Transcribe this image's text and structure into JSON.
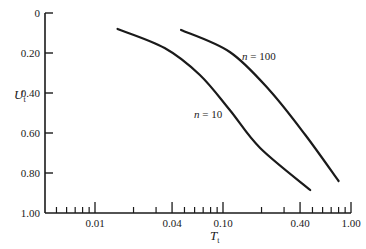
{
  "chart_data": {
    "type": "line",
    "title": "",
    "xlabel": "T_t",
    "ylabel": "U_t",
    "x_scale": "log",
    "y_inverted": true,
    "xlim": [
      0.004,
      1.0
    ],
    "ylim": [
      0,
      1.0
    ],
    "grid": false,
    "legend": "none (inline curve labels)",
    "x_ticks": [
      "0.01",
      "0.04",
      "0.10",
      "0.40",
      "1.00"
    ],
    "y_ticks": [
      "0",
      "0.20",
      "0.40",
      "0.60",
      "0.80",
      "1.00"
    ],
    "series": [
      {
        "name": "n = 10",
        "x": [
          0.015,
          0.035,
          0.066,
          0.113,
          0.195,
          0.48
        ],
        "y": [
          0.08,
          0.175,
          0.31,
          0.485,
          0.675,
          0.885
        ]
      },
      {
        "name": "n = 100",
        "x": [
          0.047,
          0.113,
          0.23,
          0.44,
          0.8
        ],
        "y": [
          0.085,
          0.195,
          0.385,
          0.61,
          0.84
        ]
      }
    ],
    "annotations": [
      {
        "text": "n = 100",
        "near_series": "n = 100"
      },
      {
        "text": "n = 10",
        "near_series": "n = 10"
      }
    ]
  },
  "labels": {
    "y_axis_main": "U",
    "y_axis_sub": "t",
    "x_axis_main": "T",
    "x_axis_sub": "t",
    "n10_var": "n",
    "n10_rest": " = 10",
    "n100_var": "n",
    "n100_rest": " = 100"
  },
  "y_ticks": [
    {
      "label": "0",
      "value": 0
    },
    {
      "label": "0.20",
      "value": 0.2
    },
    {
      "label": "0.40",
      "value": 0.4
    },
    {
      "label": "0.60",
      "value": 0.6
    },
    {
      "label": "0.80",
      "value": 0.8
    },
    {
      "label": "1.00",
      "value": 1.0
    }
  ],
  "x_major_ticks": [
    {
      "label": "0.01",
      "value": 0.01
    },
    {
      "label": "0.04",
      "value": 0.04
    },
    {
      "label": "0.10",
      "value": 0.1
    },
    {
      "label": "0.40",
      "value": 0.4
    },
    {
      "label": "1.00",
      "value": 1.0
    }
  ],
  "x_minor_ticks": [
    0.005,
    0.006,
    0.007,
    0.008,
    0.009,
    0.02,
    0.03,
    0.05,
    0.06,
    0.07,
    0.08,
    0.09,
    0.2,
    0.3,
    0.5,
    0.6,
    0.7,
    0.8,
    0.9
  ],
  "colors": {
    "ink": "#1a1a1a",
    "background": "#ffffff"
  }
}
